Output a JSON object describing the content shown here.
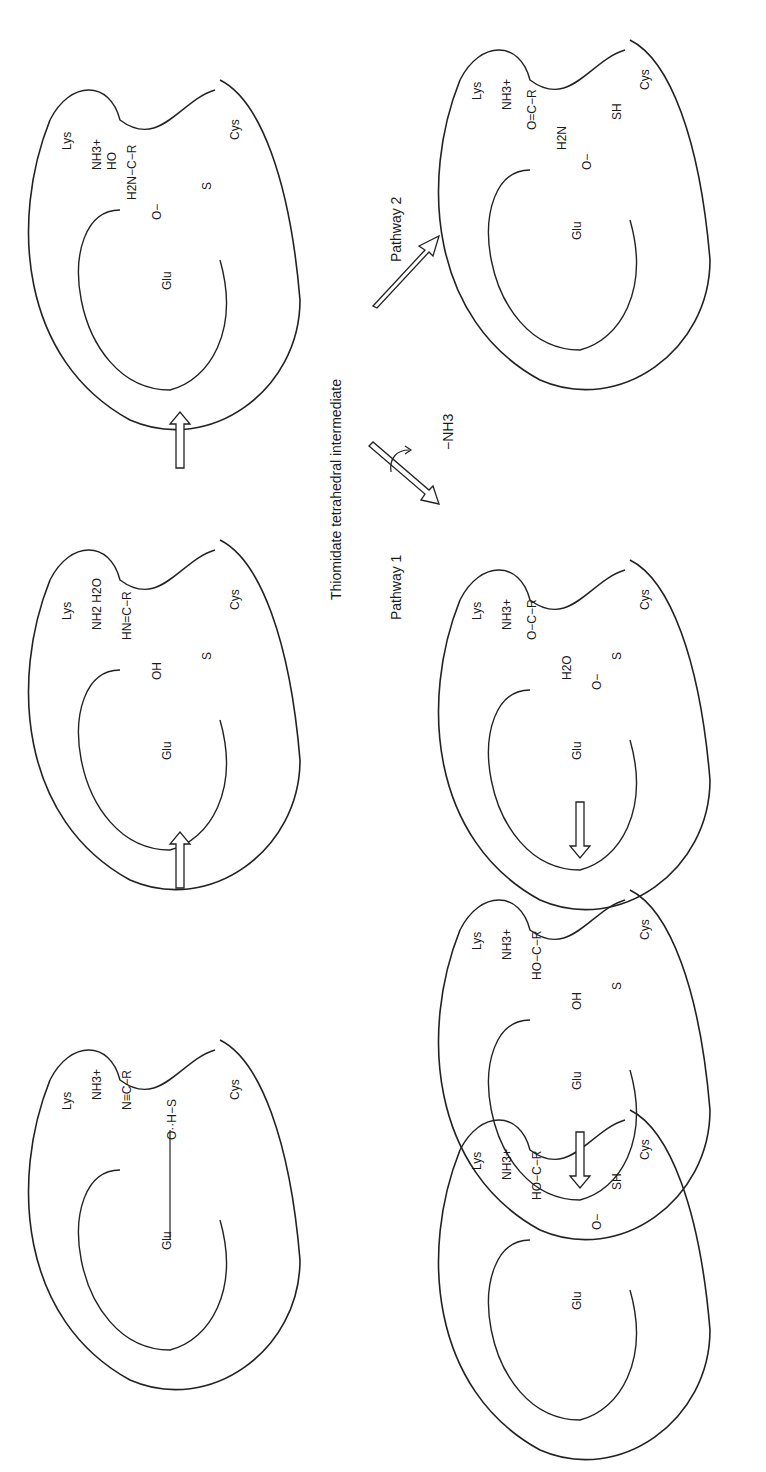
{
  "diagram": {
    "title": "Thiomidate tetrahedral intermediate",
    "orientation": "rotated -90deg (landscape scheme on portrait page)",
    "pathways": [
      {
        "label": "Pathway 1",
        "side_label": "−NH3"
      },
      {
        "label": "Pathway 2"
      }
    ],
    "residues": {
      "lys": "Lys",
      "glu": "Glu",
      "cys": "Cys"
    },
    "panels": [
      {
        "id": "p1",
        "groups": [
          "NH3+",
          "N≡C−R",
          "O··H−S"
        ],
        "residue_labels": [
          "Lys",
          "Glu",
          "Cys"
        ]
      },
      {
        "id": "p2",
        "groups": [
          "NH2 H2O",
          "HN=C−R",
          "OH",
          "S"
        ],
        "residue_labels": [
          "Lys",
          "Glu",
          "Cys"
        ]
      },
      {
        "id": "p3",
        "groups": [
          "NH3+",
          "HO",
          "H2N−C−R",
          "O−",
          "S"
        ],
        "residue_labels": [
          "Lys",
          "Glu",
          "Cys"
        ]
      },
      {
        "id": "p4",
        "groups": [
          "NH3+",
          "O−C−R",
          "H2O",
          "O−",
          "S"
        ],
        "residue_labels": [
          "Lys",
          "Glu",
          "Cys"
        ]
      },
      {
        "id": "p5",
        "groups": [
          "NH3+",
          "HO−C−R",
          "OH",
          "S"
        ],
        "residue_labels": [
          "Lys",
          "Glu",
          "Cys"
        ]
      },
      {
        "id": "p6",
        "groups": [
          "NH3+",
          "HO−C−R",
          "O−",
          "SH"
        ],
        "residue_labels": [
          "Lys",
          "Glu",
          "Cys"
        ]
      },
      {
        "id": "p7",
        "groups": [
          "NH3+",
          "O=C−R",
          "H2N",
          "O−",
          "SH"
        ],
        "residue_labels": [
          "Lys",
          "Glu",
          "Cys"
        ]
      }
    ]
  }
}
